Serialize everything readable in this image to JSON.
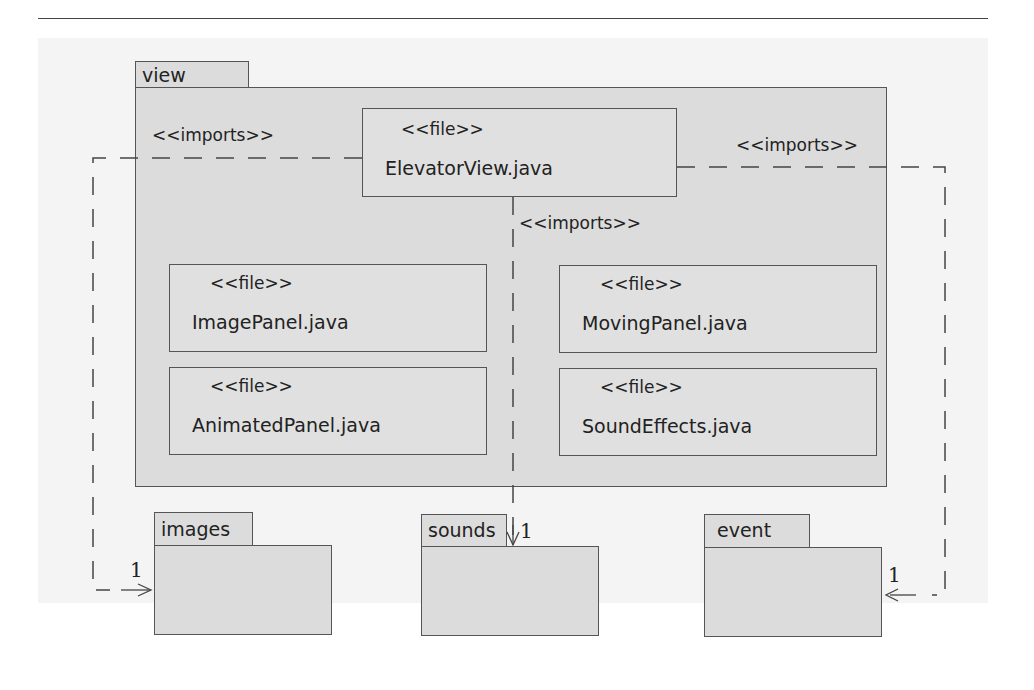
{
  "diagram": {
    "type": "UML package diagram",
    "packages": {
      "view": {
        "name": "view"
      },
      "images": {
        "name": "images"
      },
      "sounds": {
        "name": "sounds"
      },
      "event": {
        "name": "event"
      }
    },
    "files": [
      {
        "stereotype": "<<file>>",
        "name": "ElevatorView.java"
      },
      {
        "stereotype": "<<file>>",
        "name": "ImagePanel.java"
      },
      {
        "stereotype": "<<file>>",
        "name": "MovingPanel.java"
      },
      {
        "stereotype": "<<file>>",
        "name": "AnimatedPanel.java"
      },
      {
        "stereotype": "<<file>>",
        "name": "SoundEffects.java"
      }
    ],
    "dependencies": [
      {
        "label": "<<imports>>",
        "from": "ElevatorView.java",
        "to": "images",
        "multiplicity": "1"
      },
      {
        "label": "<<imports>>",
        "from": "ElevatorView.java",
        "to": "sounds",
        "multiplicity": "1"
      },
      {
        "label": "<<imports>>",
        "from": "ElevatorView.java",
        "to": "event",
        "multiplicity": "1"
      }
    ]
  }
}
